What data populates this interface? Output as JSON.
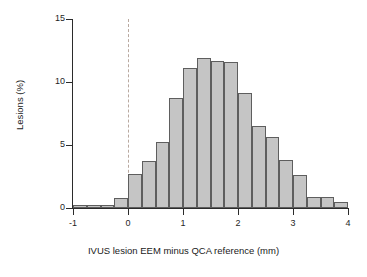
{
  "chart_data": {
    "type": "bar",
    "title": "",
    "subtitle": "",
    "xlabel": "IVUS lesion EEM minus QCA reference (mm)",
    "ylabel": "Lesions (%)",
    "xlim": [
      -1,
      4
    ],
    "ylim": [
      0,
      15
    ],
    "grid": false,
    "legend": false,
    "bin_width": 0.25,
    "bin_starts": [
      -1.0,
      -0.75,
      -0.5,
      -0.25,
      0.0,
      0.25,
      0.5,
      0.75,
      1.0,
      1.25,
      1.5,
      1.75,
      2.0,
      2.25,
      2.5,
      2.75,
      3.0,
      3.25,
      3.5,
      3.75
    ],
    "categories": [
      "-1.00",
      "-0.75",
      "-0.50",
      "-0.25",
      "0.00",
      "0.25",
      "0.50",
      "0.75",
      "1.00",
      "1.25",
      "1.50",
      "1.75",
      "2.00",
      "2.25",
      "2.50",
      "2.75",
      "3.00",
      "3.25",
      "3.50",
      "3.75"
    ],
    "values": [
      0.2,
      0.2,
      0.2,
      0.8,
      2.7,
      3.7,
      5.2,
      8.7,
      11.1,
      11.9,
      11.7,
      11.6,
      9.1,
      6.5,
      5.6,
      3.8,
      2.6,
      0.9,
      0.85,
      0.5
    ],
    "xticks": [
      -1,
      0,
      1,
      2,
      3,
      4
    ],
    "xtick_labels": [
      "-1",
      "0",
      "1",
      "2",
      "3",
      "4"
    ],
    "yticks": [
      0,
      5,
      10,
      15
    ],
    "ytick_labels": [
      "0",
      "5",
      "10",
      "15"
    ],
    "annotations": [
      {
        "name": "zero-reference-line",
        "type": "vline",
        "x": 0,
        "style": "dashed",
        "color": "#b9a9a0"
      }
    ],
    "colors": {
      "bar_fill": "#c5c5c5",
      "bar_stroke": "#5e5e5e",
      "axis": "#2b2b2b",
      "text": "#1a1a1a",
      "reference_line": "#b9a9a0",
      "background": "#ffffff"
    }
  }
}
